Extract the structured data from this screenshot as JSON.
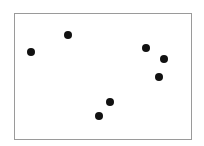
{
  "chart_data": {
    "type": "scatter",
    "title": "",
    "xlabel": "",
    "ylabel": "",
    "xlim": [
      0,
      100
    ],
    "ylim": [
      0,
      100
    ],
    "grid": false,
    "legend": null,
    "marker_color": "#111111",
    "frame_color": "#9a9a9a",
    "points": [
      {
        "x": 9.0,
        "y": 69.8
      },
      {
        "x": 29.9,
        "y": 83.3
      },
      {
        "x": 74.6,
        "y": 73.0
      },
      {
        "x": 84.7,
        "y": 64.3
      },
      {
        "x": 81.9,
        "y": 50.0
      },
      {
        "x": 54.2,
        "y": 29.4
      },
      {
        "x": 47.5,
        "y": 18.3
      }
    ]
  }
}
